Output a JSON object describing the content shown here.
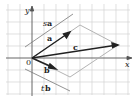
{
  "diagram": {
    "axes": {
      "x_label": "x",
      "y_label": "y",
      "origin_label": "0"
    },
    "vectors": [
      {
        "name": "a",
        "label": "a"
      },
      {
        "name": "b",
        "label": "b"
      },
      {
        "name": "c",
        "label": "c"
      }
    ],
    "scaled_lines": [
      {
        "name": "sa",
        "scalar": "s",
        "vector": "a"
      },
      {
        "name": "tb",
        "scalar": "t",
        "vector": "b"
      }
    ],
    "colors": {
      "grid": "#cfcfcf",
      "axes": "#555555",
      "vector": "#222222",
      "parallelogram": "#aaaaaa"
    }
  }
}
